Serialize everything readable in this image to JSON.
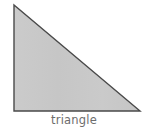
{
  "figure": {
    "caption": "triangle",
    "shape_name": "right-triangle",
    "background_color": "#ffffff",
    "fill_color": "#c8c8c8",
    "stroke_color": "#4a4a4a",
    "stroke_width": 1.4,
    "caption_color": "#6d6d6d",
    "vertices": [
      {
        "label": "apex-top-left",
        "x": 14,
        "y": 5
      },
      {
        "label": "right-angle-bottom-left",
        "x": 14,
        "y": 111
      },
      {
        "label": "bottom-right",
        "x": 140,
        "y": 111
      }
    ],
    "points_attribute": "14,5 14,111 140,111"
  }
}
